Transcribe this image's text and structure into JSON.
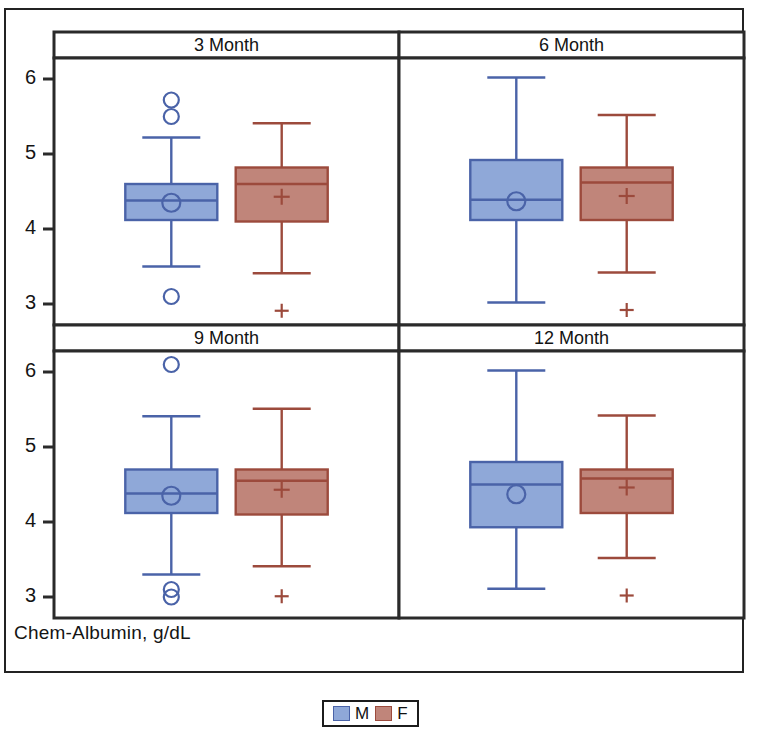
{
  "figure": {
    "axis_label": "Chem-Albumin, g/dL",
    "legend": {
      "items": [
        {
          "label": "M",
          "color": "#8fa8d8",
          "border": "#4a63a8"
        },
        {
          "label": "F",
          "color": "#c0857a",
          "border": "#9c4a3c"
        }
      ]
    },
    "panel_titles": [
      "3 Month",
      "6 Month",
      "9 Month",
      "12 Month"
    ],
    "tick_labels": [
      "6",
      "5",
      "4",
      "3"
    ]
  },
  "chart_data": {
    "type": "box",
    "title": "",
    "subtitle": "",
    "xlabel": "",
    "ylabel": "Chem-Albumin, g/dL",
    "ylim": [
      2.72,
      6.28
    ],
    "yticks": [
      3,
      4,
      5,
      6
    ],
    "grid": false,
    "legend_position": "bottom-center",
    "legend_entries": [
      "M",
      "F"
    ],
    "panel_layout": "2x2",
    "panels": [
      {
        "title": "3 Month",
        "boxes": [
          {
            "group": "M",
            "color": "#8fa8d8",
            "border": "#4a63a8",
            "marker": "circle",
            "whisker_low": 3.5,
            "q1": 4.12,
            "median": 4.38,
            "mean": 4.35,
            "q3": 4.6,
            "whisker_high": 5.22,
            "outliers": [
              5.72,
              5.5,
              3.1
            ]
          },
          {
            "group": "F",
            "color": "#c0857a",
            "border": "#9c4a3c",
            "marker": "plus",
            "whisker_low": 3.41,
            "q1": 4.1,
            "median": 4.6,
            "mean": 4.43,
            "q3": 4.82,
            "whisker_high": 5.41,
            "outliers": [
              2.91
            ]
          }
        ]
      },
      {
        "title": "6 Month",
        "boxes": [
          {
            "group": "M",
            "color": "#8fa8d8",
            "border": "#4a63a8",
            "marker": "circle",
            "whisker_low": 3.02,
            "q1": 4.12,
            "median": 4.39,
            "mean": 4.37,
            "q3": 4.92,
            "whisker_high": 6.02,
            "outliers": []
          },
          {
            "group": "F",
            "color": "#c0857a",
            "border": "#9c4a3c",
            "marker": "plus",
            "whisker_low": 3.42,
            "q1": 4.12,
            "median": 4.62,
            "mean": 4.44,
            "q3": 4.82,
            "whisker_high": 5.52,
            "outliers": [
              2.92
            ]
          }
        ]
      },
      {
        "title": "9 Month",
        "boxes": [
          {
            "group": "M",
            "color": "#8fa8d8",
            "border": "#4a63a8",
            "marker": "circle",
            "whisker_low": 3.3,
            "q1": 4.12,
            "median": 4.38,
            "mean": 4.35,
            "q3": 4.7,
            "whisker_high": 5.41,
            "outliers": [
              6.1,
              3.1,
              3.0
            ]
          },
          {
            "group": "F",
            "color": "#c0857a",
            "border": "#9c4a3c",
            "marker": "plus",
            "whisker_low": 3.41,
            "q1": 4.1,
            "median": 4.55,
            "mean": 4.43,
            "q3": 4.7,
            "whisker_high": 5.51,
            "outliers": [
              3.01
            ]
          }
        ]
      },
      {
        "title": "12 Month",
        "boxes": [
          {
            "group": "M",
            "color": "#8fa8d8",
            "border": "#4a63a8",
            "marker": "circle",
            "whisker_low": 3.11,
            "q1": 3.93,
            "median": 4.5,
            "mean": 4.37,
            "q3": 4.8,
            "whisker_high": 6.02,
            "outliers": []
          },
          {
            "group": "F",
            "color": "#c0857a",
            "border": "#9c4a3c",
            "marker": "plus",
            "whisker_low": 3.52,
            "q1": 4.12,
            "median": 4.58,
            "mean": 4.46,
            "q3": 4.7,
            "whisker_high": 5.42,
            "outliers": [
              3.02
            ]
          }
        ]
      }
    ]
  }
}
